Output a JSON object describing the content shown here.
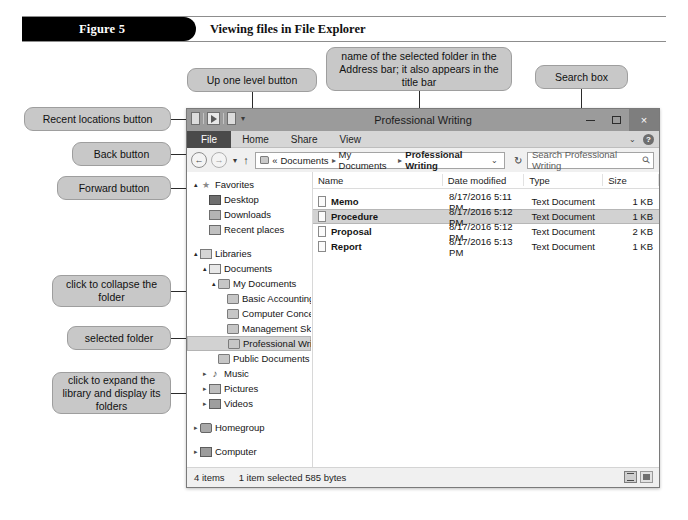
{
  "figure": {
    "tab_label": "Figure 5",
    "caption": "Viewing files in File Explorer"
  },
  "callouts": {
    "recent_locations": "Recent locations button",
    "back": "Back button",
    "forward": "Forward button",
    "up_one_level": "Up one level button",
    "address_name": "name of the selected folder in the Address bar; it also appears in the title bar",
    "search_box": "Search box",
    "collapse_folder": "click to collapse the folder",
    "selected_folder": "selected folder",
    "expand_library": "click to expand the library and display its folders",
    "contents": "contents of the selected folder"
  },
  "window": {
    "title": "Professional Writing",
    "minimize_label": "minimize",
    "maximize_label": "maximize",
    "close_label": "×",
    "quick_access_chevron": "▾",
    "ribbon_tabs": [
      {
        "label": "File",
        "active": true
      },
      {
        "label": "Home",
        "active": false
      },
      {
        "label": "Share",
        "active": false
      },
      {
        "label": "View",
        "active": false
      }
    ],
    "ribbon_chevron": "⌄",
    "help_label": "?"
  },
  "toolbar": {
    "back_glyph": "←",
    "forward_glyph": "→",
    "recent_glyph": "▾",
    "up_glyph": "↑",
    "breadcrumb_prefix": "«",
    "breadcrumb": [
      "Documents",
      "My Documents",
      "Professional Writing"
    ],
    "breadcrumb_separator": "▸",
    "breadcrumb_chevron": "⌄",
    "refresh_glyph": "↻",
    "search_placeholder": "Search Professional Writing",
    "search_glyph": "⚲"
  },
  "nav_pane": {
    "items": [
      {
        "label": "Favorites",
        "indent": 0,
        "twisty": "▴",
        "icon": "star-icon",
        "selected": false
      },
      {
        "label": "Desktop",
        "indent": 1,
        "twisty": "",
        "icon": "desktop-icon",
        "selected": false
      },
      {
        "label": "Downloads",
        "indent": 1,
        "twisty": "",
        "icon": "downloads-icon",
        "selected": false
      },
      {
        "label": "Recent places",
        "indent": 1,
        "twisty": "",
        "icon": "recent-icon",
        "selected": false
      },
      {
        "label": "",
        "indent": 0,
        "twisty": "",
        "icon": "spacer",
        "selected": false
      },
      {
        "label": "Libraries",
        "indent": 0,
        "twisty": "▴",
        "icon": "library-icon",
        "selected": false
      },
      {
        "label": "Documents",
        "indent": 1,
        "twisty": "▴",
        "icon": "document-icon",
        "selected": false
      },
      {
        "label": "My Documents",
        "indent": 2,
        "twisty": "▴",
        "icon": "folder-icon",
        "selected": false
      },
      {
        "label": "Basic Accounting",
        "indent": 3,
        "twisty": "",
        "icon": "folder-icon",
        "selected": false
      },
      {
        "label": "Computer Concepts",
        "indent": 3,
        "twisty": "",
        "icon": "folder-icon",
        "selected": false
      },
      {
        "label": "Management Skills",
        "indent": 3,
        "twisty": "",
        "icon": "folder-icon",
        "selected": false
      },
      {
        "label": "Professional Writing",
        "indent": 3,
        "twisty": "",
        "icon": "folder-icon",
        "selected": true
      },
      {
        "label": "Public Documents",
        "indent": 2,
        "twisty": "",
        "icon": "folder-icon",
        "selected": false
      },
      {
        "label": "Music",
        "indent": 1,
        "twisty": "▸",
        "icon": "music-icon",
        "selected": false
      },
      {
        "label": "Pictures",
        "indent": 1,
        "twisty": "▸",
        "icon": "pictures-icon",
        "selected": false
      },
      {
        "label": "Videos",
        "indent": 1,
        "twisty": "▸",
        "icon": "videos-icon",
        "selected": false
      },
      {
        "label": "",
        "indent": 0,
        "twisty": "",
        "icon": "spacer",
        "selected": false
      },
      {
        "label": "Homegroup",
        "indent": 0,
        "twisty": "▸",
        "icon": "homegroup-icon",
        "selected": false
      },
      {
        "label": "",
        "indent": 0,
        "twisty": "",
        "icon": "spacer",
        "selected": false
      },
      {
        "label": "Computer",
        "indent": 0,
        "twisty": "▸",
        "icon": "computer-icon",
        "selected": false
      }
    ],
    "scroll_up_glyph": "▴",
    "scroll_down_glyph": "▾"
  },
  "file_list": {
    "columns": [
      "Name",
      "Date modified",
      "Type",
      "Size"
    ],
    "rows": [
      {
        "name": "Memo",
        "date": "8/17/2016 5:11 PM",
        "type": "Text Document",
        "size": "1 KB",
        "selected": false
      },
      {
        "name": "Procedure",
        "date": "8/17/2016 5:12 PM",
        "type": "Text Document",
        "size": "1 KB",
        "selected": true
      },
      {
        "name": "Proposal",
        "date": "8/17/2016 5:12 PM",
        "type": "Text Document",
        "size": "2 KB",
        "selected": false
      },
      {
        "name": "Report",
        "date": "8/17/2016 5:13 PM",
        "type": "Text Document",
        "size": "1 KB",
        "selected": false
      }
    ]
  },
  "status_bar": {
    "item_count": "4 items",
    "selection": "1 item selected  585 bytes",
    "details_view_label": "details-view",
    "icons_view_label": "large-icons-view"
  }
}
